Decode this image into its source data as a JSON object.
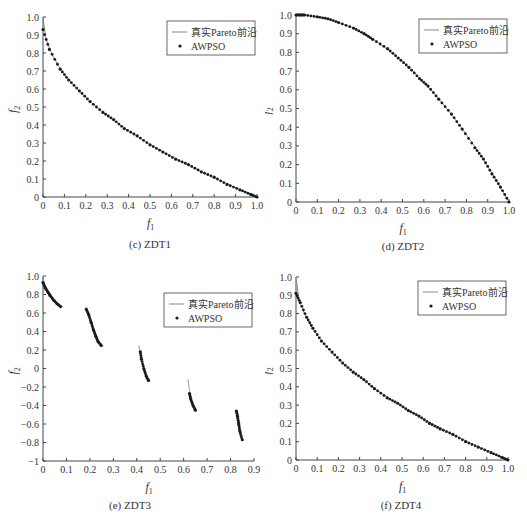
{
  "chart_data": [
    {
      "id": "c",
      "type": "line+scatter",
      "caption": "(c) ZDT1",
      "xlabel": "f1",
      "ylabel": "f2",
      "xlim": [
        0,
        1
      ],
      "ylim": [
        0,
        1
      ],
      "xticks": [
        "0",
        "0.1",
        "0.2",
        "0.3",
        "0.4",
        "0.5",
        "0.6",
        "0.7",
        "0.8",
        "0.9",
        "1.0"
      ],
      "yticks": [
        "0",
        "0.1",
        "0.2",
        "0.3",
        "0.4",
        "0.5",
        "0.6",
        "0.7",
        "0.8",
        "0.9",
        "1.0"
      ],
      "grid": false,
      "legend": {
        "position": "upper right",
        "entries": [
          "真实Pareto前沿",
          "AWPSO"
        ]
      },
      "series": [
        {
          "name": "真实Pareto前沿",
          "kind": "line",
          "function": "f2 = 1 - sqrt(f1)",
          "x": [
            0,
            0.01,
            0.05,
            0.1,
            0.2,
            0.3,
            0.4,
            0.5,
            0.6,
            0.7,
            0.8,
            0.9,
            1.0
          ],
          "y": [
            1.0,
            0.9,
            0.776,
            0.684,
            0.553,
            0.452,
            0.368,
            0.293,
            0.225,
            0.163,
            0.106,
            0.051,
            0.0
          ]
        },
        {
          "name": "AWPSO",
          "kind": "scatter",
          "x": [
            0.0,
            0.03,
            0.08,
            0.12,
            0.17,
            0.22,
            0.28,
            0.33,
            0.38,
            0.44,
            0.5,
            0.56,
            0.62,
            0.68,
            0.74,
            0.8,
            0.86,
            0.92,
            0.97,
            1.0
          ],
          "y": [
            0.93,
            0.82,
            0.71,
            0.65,
            0.59,
            0.53,
            0.47,
            0.43,
            0.38,
            0.34,
            0.29,
            0.25,
            0.21,
            0.18,
            0.14,
            0.11,
            0.07,
            0.04,
            0.015,
            0.0
          ]
        }
      ]
    },
    {
      "id": "d",
      "type": "line+scatter",
      "caption": "(d) ZDT2",
      "xlabel": "f1",
      "ylabel": "f2",
      "xlim": [
        0,
        1
      ],
      "ylim": [
        0,
        1
      ],
      "xticks": [
        "0",
        "0.1",
        "0.2",
        "0.3",
        "0.4",
        "0.5",
        "0.6",
        "0.7",
        "0.8",
        "0.9",
        "1.0"
      ],
      "yticks": [
        "0",
        "0.1",
        "0.2",
        "0.3",
        "0.4",
        "0.5",
        "0.6",
        "0.7",
        "0.8",
        "0.9",
        "1.0"
      ],
      "grid": false,
      "legend": {
        "position": "upper right",
        "entries": [
          "真实Pareto前沿",
          "AWPSO"
        ]
      },
      "series": [
        {
          "name": "真实Pareto前沿",
          "kind": "line",
          "function": "f2 = 1 - f1^2",
          "x": [
            0,
            0.1,
            0.2,
            0.3,
            0.4,
            0.5,
            0.6,
            0.7,
            0.8,
            0.9,
            1.0
          ],
          "y": [
            1.0,
            0.99,
            0.96,
            0.91,
            0.84,
            0.75,
            0.64,
            0.51,
            0.36,
            0.19,
            0.0
          ]
        },
        {
          "name": "AWPSO",
          "kind": "scatter",
          "x": [
            0.0,
            0.02,
            0.04,
            0.1,
            0.15,
            0.2,
            0.27,
            0.32,
            0.36,
            0.43,
            0.48,
            0.53,
            0.58,
            0.62,
            0.67,
            0.73,
            0.78,
            0.84,
            0.88,
            0.92,
            0.96,
            1.0
          ],
          "y": [
            1.0,
            1.0,
            1.0,
            0.99,
            0.98,
            0.96,
            0.93,
            0.9,
            0.87,
            0.82,
            0.77,
            0.72,
            0.66,
            0.62,
            0.55,
            0.47,
            0.39,
            0.29,
            0.23,
            0.15,
            0.08,
            0.0
          ]
        }
      ]
    },
    {
      "id": "e",
      "type": "line+scatter",
      "caption": "(e) ZDT3",
      "xlabel": "f1",
      "ylabel": "f2",
      "xlim": [
        0,
        0.9
      ],
      "ylim": [
        -1,
        1
      ],
      "xticks": [
        "0",
        "0.1",
        "0.2",
        "0.3",
        "0.4",
        "0.5",
        "0.6",
        "0.7",
        "0.8",
        "0.9"
      ],
      "yticks": [
        "−1",
        "−0.8",
        "−0.6",
        "−0.4",
        "−0.2",
        "0",
        "0.2",
        "0.4",
        "0.6",
        "0.8",
        "1.0"
      ],
      "grid": false,
      "legend": {
        "position": "upper right",
        "entries": [
          "真实Pareto前沿",
          "AWPSO"
        ]
      },
      "series": [
        {
          "name": "真实Pareto前沿",
          "kind": "line",
          "function": "f2 = 1 - sqrt(f1) - f1*sin(10*pi*f1)",
          "segments": [
            [
              0.0,
              0.083
            ],
            [
              0.182,
              0.258
            ],
            [
              0.409,
              0.454
            ],
            [
              0.618,
              0.653
            ],
            [
              0.823,
              0.852
            ]
          ]
        },
        {
          "name": "AWPSO",
          "kind": "scatter",
          "x": [
            0.0,
            0.01,
            0.02,
            0.03,
            0.045,
            0.06,
            0.075,
            0.185,
            0.195,
            0.205,
            0.215,
            0.225,
            0.235,
            0.248,
            0.415,
            0.42,
            0.43,
            0.44,
            0.45,
            0.625,
            0.63,
            0.64,
            0.65,
            0.825,
            0.83,
            0.835,
            0.84,
            0.85
          ],
          "y": [
            0.93,
            0.87,
            0.83,
            0.79,
            0.74,
            0.7,
            0.67,
            0.64,
            0.58,
            0.5,
            0.42,
            0.35,
            0.29,
            0.25,
            0.18,
            0.1,
            0.0,
            -0.08,
            -0.13,
            -0.27,
            -0.33,
            -0.4,
            -0.45,
            -0.46,
            -0.52,
            -0.6,
            -0.68,
            -0.77
          ]
        }
      ]
    },
    {
      "id": "f",
      "type": "line+scatter",
      "caption": "(f) ZDT4",
      "xlabel": "f1",
      "ylabel": "f2",
      "xlim": [
        0,
        1
      ],
      "ylim": [
        0,
        1
      ],
      "xticks": [
        "0",
        "0.1",
        "0.2",
        "0.3",
        "0.4",
        "0.5",
        "0.6",
        "0.7",
        "0.8",
        "0.9",
        "1.0"
      ],
      "yticks": [
        "0",
        "0.1",
        "0.2",
        "0.3",
        "0.4",
        "0.5",
        "0.6",
        "0.7",
        "0.8",
        "0.9",
        "1.0"
      ],
      "grid": false,
      "legend": {
        "position": "upper right",
        "entries": [
          "真实Pareto前沿",
          "AWPSO"
        ]
      },
      "series": [
        {
          "name": "真实Pareto前沿",
          "kind": "line",
          "function": "f2 = 1 - sqrt(f1)",
          "x": [
            0,
            0.01,
            0.05,
            0.1,
            0.2,
            0.3,
            0.4,
            0.5,
            0.6,
            0.7,
            0.8,
            0.9,
            1.0
          ],
          "y": [
            1.0,
            0.9,
            0.776,
            0.684,
            0.553,
            0.452,
            0.368,
            0.293,
            0.225,
            0.163,
            0.106,
            0.051,
            0.0
          ]
        },
        {
          "name": "AWPSO",
          "kind": "scatter",
          "x": [
            0.0,
            0.02,
            0.05,
            0.08,
            0.12,
            0.17,
            0.22,
            0.27,
            0.32,
            0.37,
            0.43,
            0.48,
            0.53,
            0.58,
            0.63,
            0.68,
            0.74,
            0.8,
            0.86,
            0.92,
            0.97,
            1.0
          ],
          "y": [
            0.91,
            0.86,
            0.78,
            0.72,
            0.65,
            0.59,
            0.53,
            0.48,
            0.44,
            0.39,
            0.34,
            0.31,
            0.27,
            0.24,
            0.2,
            0.17,
            0.14,
            0.1,
            0.07,
            0.04,
            0.015,
            0.0
          ]
        }
      ]
    }
  ],
  "panels": {
    "c": {
      "caption": "(c) ZDT1"
    },
    "d": {
      "caption": "(d) ZDT2"
    },
    "e": {
      "caption": "(e) ZDT3"
    },
    "f": {
      "caption": "(f) ZDT4"
    }
  },
  "legend": {
    "line_label": "真实Pareto前沿",
    "marker_label": "AWPSO"
  },
  "axis_labels": {
    "x": "f",
    "x_sub": "1",
    "y": "f",
    "y_sub": "2"
  },
  "colors": {
    "line": "#888888",
    "marker": "#1a1a1a",
    "axis": "#444444"
  }
}
